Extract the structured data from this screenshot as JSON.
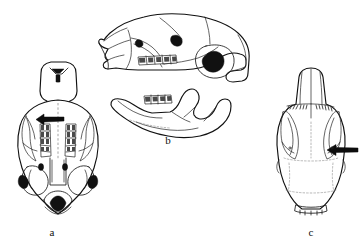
{
  "figure": {
    "kind": "scientific-line-illustration",
    "background_color": "#ffffff",
    "ink_color": "#111111",
    "panels": [
      {
        "id": "a",
        "caption": "a",
        "view": "ventral view of cranium",
        "caption_x": 52,
        "caption_y": 236,
        "annotation": {
          "type": "arrow",
          "direction": "left",
          "target": "palatal region between molar rows"
        }
      },
      {
        "id": "b",
        "caption": "b",
        "view": "lateral view of cranium and mandible",
        "caption_x": 168,
        "caption_y": 144,
        "annotation": null
      },
      {
        "id": "c",
        "caption": "c",
        "view": "dorsal view of cranium",
        "caption_x": 311,
        "caption_y": 236,
        "annotation": {
          "type": "arrow",
          "direction": "left",
          "target": "right zygomatic plate / orbital region"
        }
      }
    ]
  },
  "colors": {
    "background": "#ffffff",
    "outline": "#111111",
    "filled_foramen": "#111111",
    "dotted_suture": "#888888",
    "arrow": "#0d0d0d"
  }
}
